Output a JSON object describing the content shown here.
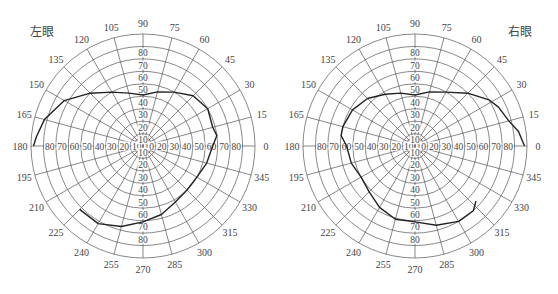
{
  "chart_data": [
    {
      "type": "polar-line",
      "title": "左眼",
      "center_px": [
        143,
        146
      ],
      "radius_scale": {
        "max": 90,
        "rings": [
          10,
          20,
          30,
          40,
          50,
          60,
          70,
          80,
          90
        ]
      },
      "angle_ticks": [
        0,
        15,
        30,
        45,
        60,
        75,
        90,
        105,
        120,
        135,
        150,
        165,
        180,
        195,
        210,
        225,
        240,
        255,
        270,
        285,
        300,
        315,
        330,
        345
      ],
      "radial_tick_labels": [
        "10",
        "20",
        "30",
        "40",
        "50",
        "60",
        "70",
        "80"
      ],
      "series": [
        {
          "name": "visual-field-boundary",
          "points": [
            [
              225,
              72
            ],
            [
              240,
              72
            ],
            [
              255,
              67
            ],
            [
              270,
              61
            ],
            [
              285,
              57
            ],
            [
              300,
              52
            ],
            [
              315,
              50
            ],
            [
              330,
              50
            ],
            [
              345,
              53
            ],
            [
              0,
              56
            ],
            [
              8,
              60
            ],
            [
              15,
              58
            ],
            [
              30,
              60
            ],
            [
              45,
              57
            ],
            [
              60,
              50
            ],
            [
              75,
              45
            ],
            [
              90,
              41
            ],
            [
              105,
              44
            ],
            [
              120,
              50
            ],
            [
              135,
              60
            ],
            [
              150,
              73
            ],
            [
              165,
              82
            ],
            [
              175,
              86
            ],
            [
              180,
              88
            ]
          ]
        }
      ]
    },
    {
      "type": "polar-line",
      "title": "右眼",
      "center_px": [
        415,
        146
      ],
      "radius_scale": {
        "max": 90,
        "rings": [
          10,
          20,
          30,
          40,
          50,
          60,
          70,
          80,
          90
        ]
      },
      "angle_ticks": [
        0,
        15,
        30,
        45,
        60,
        75,
        90,
        105,
        120,
        135,
        150,
        165,
        180,
        195,
        210,
        225,
        240,
        255,
        270,
        285,
        300,
        315,
        330,
        345
      ],
      "radial_tick_labels": [
        "10",
        "20",
        "30",
        "40",
        "50",
        "60",
        "70",
        "80"
      ],
      "series": [
        {
          "name": "visual-field-boundary",
          "points": [
            [
              0,
              88
            ],
            [
              8,
              84
            ],
            [
              15,
              78
            ],
            [
              25,
              74
            ],
            [
              32,
              70
            ],
            [
              45,
              60
            ],
            [
              60,
              50
            ],
            [
              75,
              45
            ],
            [
              90,
              41
            ],
            [
              105,
              44
            ],
            [
              120,
              48
            ],
            [
              135,
              54
            ],
            [
              150,
              58
            ],
            [
              165,
              60
            ],
            [
              172,
              60
            ],
            [
              180,
              55
            ],
            [
              195,
              53
            ],
            [
              210,
              50
            ],
            [
              225,
              52
            ],
            [
              240,
              57
            ],
            [
              255,
              61
            ],
            [
              270,
              61
            ],
            [
              285,
              66
            ],
            [
              300,
              70
            ],
            [
              312,
              70
            ],
            [
              318,
              66
            ]
          ]
        }
      ]
    }
  ],
  "labels": {
    "left_eye": "左眼",
    "right_eye": "右眼"
  },
  "style": {
    "grid_color": "#555555",
    "curve_color": "#222222",
    "center_color": "#111111"
  }
}
